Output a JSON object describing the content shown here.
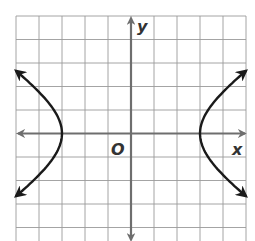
{
  "chart_data": {
    "type": "line",
    "title": "",
    "equation": "x^2/9 - y^2/4 = 1",
    "vertices": [
      [
        -3,
        0
      ],
      [
        3,
        0
      ]
    ],
    "xlabel": "x",
    "ylabel": "y",
    "origin_label": "O",
    "xlim": [
      -5,
      5
    ],
    "ylim": [
      -4.6,
      5
    ],
    "grid": true,
    "grid_step": 1,
    "series": [
      {
        "name": "left branch",
        "points": [
          [
            -5,
            2.67
          ],
          [
            -4,
            1.76
          ],
          [
            -3.5,
            1.2
          ],
          [
            -3,
            0
          ],
          [
            -3.5,
            -1.2
          ],
          [
            -4,
            -1.76
          ],
          [
            -5,
            -2.67
          ]
        ]
      },
      {
        "name": "right branch",
        "points": [
          [
            5,
            2.67
          ],
          [
            4,
            1.76
          ],
          [
            3.5,
            1.2
          ],
          [
            3,
            0
          ],
          [
            3.5,
            -1.2
          ],
          [
            4,
            -1.76
          ],
          [
            5,
            -2.67
          ]
        ]
      }
    ]
  },
  "labels": {
    "x_axis": "x",
    "y_axis": "y",
    "origin": "O"
  },
  "colors": {
    "grid": "#9a9a9a",
    "axis": "#6e6e6e",
    "curve": "#1a1a1a"
  }
}
